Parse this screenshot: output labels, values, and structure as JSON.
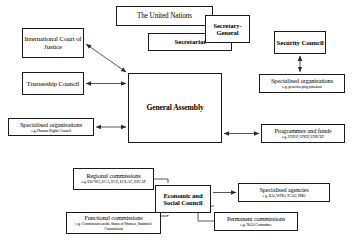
{
  "diagram": {
    "type": "organisational-diagram",
    "line_color": "#1a1a1a",
    "box_fill": "#ffffff",
    "nodes": {
      "united_nations": {
        "title": "The United Nations"
      },
      "secretary_general": {
        "title": "Secretary-General"
      },
      "secretariat": {
        "title": "Secretariat"
      },
      "icj": {
        "title": "International Court of Justice"
      },
      "trusteeship_council": {
        "title": "Trusteeship Council"
      },
      "specialised_human_rights": {
        "title": "Specialised organisations",
        "subtitle": "e.g. Human Rights Council"
      },
      "general_assembly": {
        "title": "General Assembly"
      },
      "security_council": {
        "title": "Security Council"
      },
      "specialised_peacekeeping": {
        "title": "Specialised organisations",
        "subtitle": "e.g. peacekeeping missions"
      },
      "programmes_and_funds": {
        "title": "Programmes and funds",
        "subtitle": "e.g. UNDP, UNEP, UNICEF"
      },
      "regional_commissions": {
        "title": "Regional commissions",
        "subtitle": "e.g. ESCWA, ECA, ECE, ECLAC, ESCAP"
      },
      "ecosoc": {
        "title": "Economic and Social Council"
      },
      "functional_commissions": {
        "title": "Functional commissions",
        "subtitle": "e.g. Commission on the Status of Women, Statistical Commission"
      },
      "specialised_agencies": {
        "title": "Specialised agencies",
        "subtitle": "e.g. ILO, WHO, ICAO, IMO"
      },
      "permanent_commissions": {
        "title": "Permanent commissions",
        "subtitle": "e.g. NGO Committee"
      }
    },
    "connections": [
      {
        "from": "icj",
        "to": "general_assembly",
        "style": "double-arrow-diagonal"
      },
      {
        "from": "trusteeship_council",
        "to": "general_assembly",
        "style": "double-arrow-horizontal"
      },
      {
        "from": "specialised_human_rights",
        "to": "general_assembly",
        "style": "double-arrow-horizontal"
      },
      {
        "from": "general_assembly",
        "to": "programmes_and_funds",
        "style": "double-arrow-horizontal"
      },
      {
        "from": "specialised_peacekeeping",
        "to": "security_council",
        "style": "double-arrow-vertical"
      },
      {
        "from": "regional_commissions",
        "to": "ecosoc",
        "style": "elbow"
      },
      {
        "from": "functional_commissions",
        "to": "ecosoc",
        "style": "elbow"
      },
      {
        "from": "ecosoc",
        "to": "specialised_agencies",
        "style": "arrow"
      },
      {
        "from": "ecosoc",
        "to": "permanent_commissions",
        "style": "elbow"
      }
    ]
  }
}
